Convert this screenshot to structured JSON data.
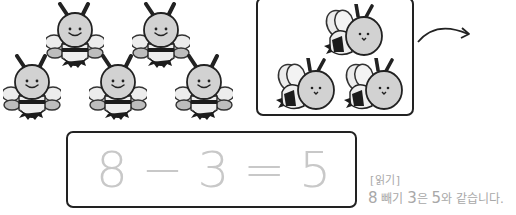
{
  "scene": {
    "remaining_bees_count": 5,
    "removed_bees_count": 3,
    "colors": {
      "outline": "#222222",
      "body": "#d2d2d2",
      "wing": "#ececec",
      "wing_lower": "#bdbdbd",
      "stripe": "#1c1c1c",
      "equation": "#c8c8c8",
      "reading_text": "#a8a8a8"
    }
  },
  "equation": {
    "tokens": [
      "8",
      "−",
      "3",
      "=",
      "5"
    ]
  },
  "reading": {
    "label": "[읽기]",
    "parts": [
      "8",
      " 빼기 ",
      "3",
      "은 ",
      "5",
      "와 같습니다."
    ]
  },
  "icons": {
    "bee": "bee-icon",
    "flying_bee": "flying-bee-icon",
    "arrow": "curved-arrow-icon"
  }
}
